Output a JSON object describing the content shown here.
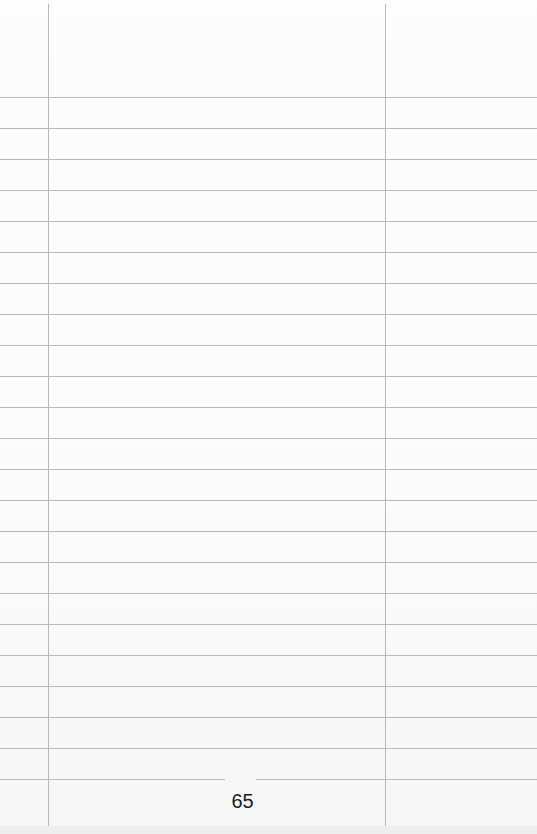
{
  "page": {
    "page_number": "65",
    "layout": {
      "background": "#fbfbfb",
      "rule_color": "#b9b9b9",
      "left_margin_x": 48,
      "right_column_x": 385,
      "rule_start_y": 97,
      "rule_spacing": 31,
      "rule_count": 23
    }
  }
}
